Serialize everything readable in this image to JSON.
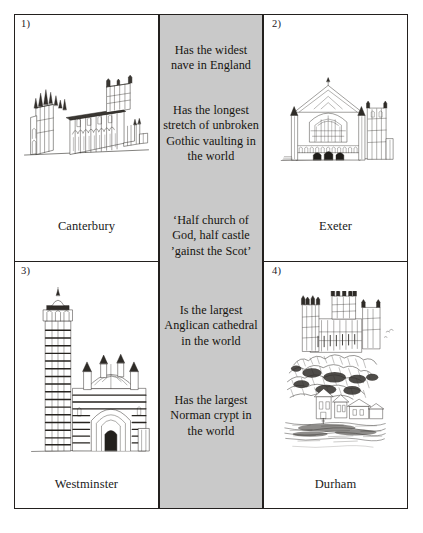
{
  "page": {
    "background_color": "#ffffff",
    "frame_border_color": "#23201e"
  },
  "facts_column": {
    "name": "facts",
    "background_color": "#c9c9c9",
    "items": [
      {
        "id": "fact-0",
        "text": "Has the widest nave in England"
      },
      {
        "id": "fact-1",
        "text": "Has the longest stretch of unbroken Gothic vaulting in the world"
      },
      {
        "id": "fact-2",
        "text": "‘Half church of God, half castle ’gainst the Scot’"
      },
      {
        "id": "fact-3",
        "text": "Is the largest Anglican cathedral in the world"
      },
      {
        "id": "fact-4",
        "text": "Has the largest Norman crypt in the world"
      }
    ]
  },
  "cells": [
    {
      "number": "1)",
      "caption": "Canterbury",
      "illustration": "canterbury-cathedral-drawing",
      "position": "top-left"
    },
    {
      "number": "2)",
      "caption": "Exeter",
      "illustration": "exeter-cathedral-drawing",
      "position": "top-right"
    },
    {
      "number": "3)",
      "caption": "Westminster",
      "illustration": "westminster-cathedral-drawing",
      "position": "bottom-left"
    },
    {
      "number": "4)",
      "caption": "Durham",
      "illustration": "durham-cathedral-drawing",
      "position": "bottom-right"
    }
  ]
}
